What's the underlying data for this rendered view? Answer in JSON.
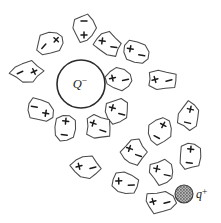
{
  "figure": {
    "background_color": "#ffffff",
    "width": 221,
    "height": 223
  },
  "central_charge": {
    "name": "central-negative-charge",
    "symbol": "Q",
    "sign": "−",
    "label": "Q⁻",
    "cx": 81,
    "cy": 84,
    "r": 24,
    "stroke_color": "#2b2b2b",
    "fill_color": "#ffffff"
  },
  "test_charge": {
    "name": "test-positive-charge",
    "symbol": "q",
    "sign": "+",
    "label": "q+",
    "cx": 184,
    "cy": 194,
    "r": 9,
    "fill_pattern": "stipple-gray",
    "fill_color": "#8c8c8c",
    "stroke_color": "#3a3a3a",
    "label_x": 196,
    "label_y": 198
  },
  "dipole_legend": {
    "plus_symbol": "+",
    "minus_symbol": "−",
    "description": "Each oval molecule is polarized with its + end pointing toward Q⁻"
  },
  "dipoles": [
    {
      "id": 1,
      "cx": 84,
      "cy": 28,
      "rx": 12,
      "ry": 15,
      "angle": 0,
      "plus_at": "bottom"
    },
    {
      "id": 2,
      "cx": 50,
      "cy": 43,
      "rx": 16,
      "ry": 12,
      "angle": -28,
      "plus_at": "right"
    },
    {
      "id": 3,
      "cx": 108,
      "cy": 44,
      "rx": 15,
      "ry": 12,
      "angle": 28,
      "plus_at": "left"
    },
    {
      "id": 4,
      "cx": 136,
      "cy": 52,
      "rx": 15,
      "ry": 12,
      "angle": 30,
      "plus_at": "left"
    },
    {
      "id": 5,
      "cx": 27,
      "cy": 72,
      "rx": 17,
      "ry": 11,
      "angle": -4,
      "plus_at": "right"
    },
    {
      "id": 6,
      "cx": 119,
      "cy": 79,
      "rx": 15,
      "ry": 12,
      "angle": 8,
      "plus_at": "left"
    },
    {
      "id": 7,
      "cx": 162,
      "cy": 80,
      "rx": 16,
      "ry": 11,
      "angle": 4,
      "plus_at": "left"
    },
    {
      "id": 8,
      "cx": 40,
      "cy": 110,
      "rx": 15,
      "ry": 12,
      "angle": 30,
      "plus_at": "right"
    },
    {
      "id": 9,
      "cx": 117,
      "cy": 111,
      "rx": 13,
      "ry": 14,
      "angle": 35,
      "plus_at": "left"
    },
    {
      "id": 10,
      "cx": 189,
      "cy": 116,
      "rx": 12,
      "ry": 15,
      "angle": 12,
      "plus_at": "top"
    },
    {
      "id": 11,
      "cx": 65,
      "cy": 128,
      "rx": 12,
      "ry": 15,
      "angle": 6,
      "plus_at": "top"
    },
    {
      "id": 12,
      "cx": 98,
      "cy": 127,
      "rx": 14,
      "ry": 13,
      "angle": 38,
      "plus_at": "left"
    },
    {
      "id": 13,
      "cx": 160,
      "cy": 131,
      "rx": 13,
      "ry": 15,
      "angle": 28,
      "plus_at": "top"
    },
    {
      "id": 14,
      "cx": 134,
      "cy": 152,
      "rx": 13,
      "ry": 14,
      "angle": 38,
      "plus_at": "left"
    },
    {
      "id": 15,
      "cx": 190,
      "cy": 156,
      "rx": 12,
      "ry": 15,
      "angle": 6,
      "plus_at": "top"
    },
    {
      "id": 16,
      "cx": 86,
      "cy": 167,
      "rx": 16,
      "ry": 12,
      "angle": 6,
      "plus_at": "left"
    },
    {
      "id": 17,
      "cx": 162,
      "cy": 172,
      "rx": 14,
      "ry": 13,
      "angle": 32,
      "plus_at": "left"
    },
    {
      "id": 18,
      "cx": 125,
      "cy": 183,
      "rx": 15,
      "ry": 12,
      "angle": 18,
      "plus_at": "left"
    },
    {
      "id": 19,
      "cx": 160,
      "cy": 202,
      "rx": 16,
      "ry": 12,
      "angle": 4,
      "plus_at": "left"
    }
  ]
}
